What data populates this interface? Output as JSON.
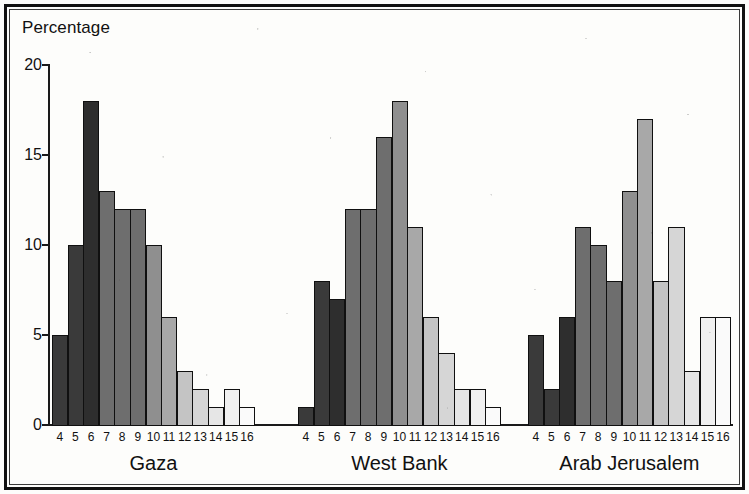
{
  "figure": {
    "y_axis_title": "Percentage"
  },
  "chart_data": {
    "type": "bar",
    "title": "Percentage",
    "xlabel": "",
    "ylabel": "Percentage",
    "ylim": [
      0,
      20
    ],
    "yticks": [
      0,
      5,
      10,
      15,
      20
    ],
    "grid": false,
    "legend_position": "none",
    "categories": [
      "4",
      "5",
      "6",
      "7",
      "8",
      "9",
      "10",
      "11",
      "12",
      "13",
      "14",
      "15",
      "16"
    ],
    "groups": [
      {
        "name": "Gaza",
        "categories": [
          "4",
          "5",
          "6",
          "7",
          "8",
          "9",
          "10",
          "11",
          "12",
          "13",
          "14",
          "15",
          "16"
        ],
        "values": [
          5,
          10,
          18,
          13,
          12,
          12,
          10,
          6,
          3,
          2,
          1,
          2,
          1
        ]
      },
      {
        "name": "West Bank",
        "categories": [
          "4",
          "5",
          "6",
          "7",
          "8",
          "9",
          "10",
          "11",
          "12",
          "13",
          "14",
          "15",
          "16"
        ],
        "values": [
          1,
          8,
          7,
          12,
          12,
          16,
          18,
          11,
          6,
          4,
          2,
          2,
          1
        ]
      },
      {
        "name": "Arab Jerusalem",
        "categories": [
          "4",
          "5",
          "6",
          "7",
          "8",
          "9",
          "10",
          "11",
          "12",
          "13",
          "14",
          "15",
          "16"
        ],
        "values": [
          5,
          2,
          6,
          11,
          10,
          8,
          13,
          17,
          8,
          11,
          3,
          6,
          6
        ]
      }
    ],
    "series": [
      {
        "name": "Gaza",
        "values": [
          5,
          10,
          18,
          13,
          12,
          12,
          10,
          6,
          3,
          2,
          1,
          2,
          1
        ]
      },
      {
        "name": "West Bank",
        "values": [
          1,
          8,
          7,
          12,
          12,
          16,
          18,
          11,
          6,
          4,
          2,
          2,
          1
        ]
      },
      {
        "name": "Arab Jerusalem",
        "values": [
          5,
          2,
          6,
          11,
          10,
          8,
          13,
          17,
          8,
          11,
          3,
          6,
          6
        ]
      }
    ],
    "bar_fill_ramp": [
      "#3a3a3a",
      "#3a3a3a",
      "#2e2e2e",
      "#6e6e6e",
      "#6e6e6e",
      "#6e6e6e",
      "#8f8f8f",
      "#a8a8a8",
      "#c4c4c4",
      "#d6d6d6",
      "#e6e6e6",
      "#f0f0f0",
      "#fafafa"
    ],
    "colors": {
      "axis": "#1a1a1a",
      "text": "#111111",
      "background": "#fdfdfb",
      "outline": "#101010"
    }
  }
}
